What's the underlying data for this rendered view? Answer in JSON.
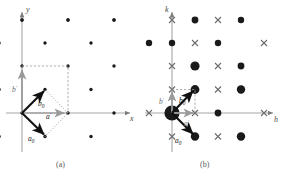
{
  "figure": {
    "panels": [
      {
        "id": "a",
        "caption": "(a)",
        "axes": {
          "x_label": "x",
          "y_label": "y"
        },
        "description": "centered rectangular direct lattice with primitive and conventional basis vectors",
        "vectors": [
          {
            "name": "a-prime",
            "label": "a",
            "sub": "′",
            "color": "#111111"
          },
          {
            "name": "a-zero",
            "label": "a",
            "sub": "0",
            "color": "#111111"
          },
          {
            "name": "b-prime",
            "label": "b",
            "sub": "′",
            "color": "#6e6e6e"
          },
          {
            "name": "b-zero",
            "label": "b",
            "sub": "0",
            "color": "#111111"
          }
        ],
        "lattice": {
          "marker": "dot",
          "marker_color": "#1a1a1a",
          "cell_outline_color": "#8a8a8a",
          "cols": 4,
          "rows": 5
        }
      },
      {
        "id": "b",
        "caption": "(b)",
        "axes": {
          "x_label": "h",
          "y_label": "k"
        },
        "description": "reciprocal lattice with alternating strong (dot) and extinct (cross) reflections",
        "vectors": [
          {
            "name": "a-prime",
            "label": "a",
            "sub": "′",
            "color": "#6e6e6e"
          },
          {
            "name": "a-zero",
            "label": "a",
            "sub": "0",
            "color": "#111111"
          },
          {
            "name": "b-prime",
            "label": "b",
            "sub": "′",
            "color": "#6e6e6e"
          },
          {
            "name": "b-zero",
            "label": "b",
            "sub": "0",
            "color": "#111111"
          }
        ],
        "lattice": {
          "marker": "dot-and-cross",
          "marker_color": "#1a1a1a",
          "cross_color": "#6b6b6b",
          "cell_outline_color": "#8a8a8a",
          "cols": 5,
          "rows": 5
        }
      }
    ]
  }
}
